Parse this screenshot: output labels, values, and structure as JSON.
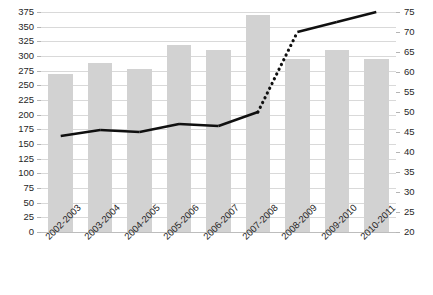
{
  "chart_data": {
    "type": "bar",
    "title": "",
    "xlabel": "",
    "ylabel": "",
    "grid": true,
    "legend": "none",
    "categories": [
      "2002-2003",
      "2003-2004",
      "2004-2005",
      "2005-2006",
      "2006-2007",
      "2007-2008",
      "2008-2009",
      "2009-2010",
      "2010-2011"
    ],
    "series": [
      {
        "name": "bars",
        "type": "bar",
        "axis": "left",
        "values": [
          270,
          288,
          278,
          318,
          310,
          370,
          295,
          310,
          295
        ]
      },
      {
        "name": "line",
        "type": "line",
        "axis": "right",
        "style": "solid-with-dotted-segment",
        "dotted_between": [
          "2007-2008",
          "2008-2009"
        ],
        "values": [
          44,
          45.5,
          45,
          47,
          46.5,
          50,
          70,
          72.5,
          75
        ]
      }
    ],
    "left_axis": {
      "min": 0,
      "max": 375,
      "step": 25,
      "ticks": [
        0,
        25,
        50,
        75,
        100,
        125,
        150,
        175,
        200,
        225,
        250,
        275,
        300,
        325,
        350,
        375
      ]
    },
    "right_axis": {
      "min": 20,
      "max": 75,
      "step": 5,
      "ticks": [
        20,
        25,
        30,
        35,
        40,
        45,
        50,
        55,
        60,
        65,
        70,
        75
      ]
    },
    "colors": {
      "bar": "#d2d2d2",
      "line": "#101010",
      "grid": "#d9d9d9",
      "text": "#262626"
    }
  }
}
